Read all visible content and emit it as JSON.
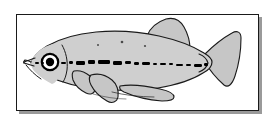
{
  "figure": {
    "kind": "scientific-line-illustration",
    "common_name": "medaka",
    "orientation": "lateral view, facing left",
    "caption": "",
    "background_color": "#ffffff"
  },
  "frame": {
    "border_color": "#1a1a1a",
    "border_width": 1,
    "fill_color": "#ffffff",
    "shadow_color": "#9a9a9a",
    "shadow_offset_x": 3,
    "shadow_offset_y": 3,
    "x": 16,
    "y": 14,
    "width": 243,
    "height": 97
  },
  "colors": {
    "body_fill": "#cfcfcf",
    "fin_fill": "#c6c6c6",
    "outline": "#1a1a1a",
    "stripe": "#000000",
    "eye_pupil": "#000000",
    "eye_ring": "#000000",
    "eye_white": "#ffffff",
    "spot": "#4a4a4a"
  },
  "anatomy": {
    "parts": [
      {
        "name": "body",
        "label": "Body"
      },
      {
        "name": "head",
        "label": "Head"
      },
      {
        "name": "eye",
        "label": "Eye"
      },
      {
        "name": "mouth",
        "label": "Mouth"
      },
      {
        "name": "operculum",
        "label": "Operculum"
      },
      {
        "name": "lateral-stripe",
        "label": "Lateral stripe"
      },
      {
        "name": "dorsal-fin",
        "label": "Dorsal fin"
      },
      {
        "name": "pectoral-fin",
        "label": "Pectoral fin"
      },
      {
        "name": "pelvic-fin",
        "label": "Pelvic fin"
      },
      {
        "name": "anal-fin",
        "label": "Anal fin"
      },
      {
        "name": "caudal-peduncle",
        "label": "Caudal peduncle"
      },
      {
        "name": "caudal-fin",
        "label": "Caudal fin"
      }
    ]
  },
  "geometry": {
    "body_path": "M 31 63 C 33 58 38 52 46 47 C 58 40 74 35 95 33 C 118 31 140 33 158 37 C 176 41 192 47 203 53 C 208 56 211 59 212 62 C 212 66 209 70 203 73 C 192 79 176 84 158 87 C 140 90 118 90 98 88 C 78 86 60 81 48 75 C 40 71 34 67 31 63 Z",
    "head_path": "M 26 63 C 27 60 29 57 32 54 C 36 50 42 46 49 43 C 54 41 58 44 60 48 L 62 56 C 63 60 63 66 62 70 L 60 78 C 58 83 53 85 48 83 C 41 80 35 75 30 70 C 28 67 26 65 26 63 Z",
    "mouth_path": "M 26 62 L 34 59 M 26 63 L 33 65 M 26 62 C 24 61 22 61 21 62 C 22 63 24 64 26 64",
    "eye": {
      "cx": 50,
      "cy": 62,
      "r_outer": 8.5,
      "r_inner": 4.2
    },
    "dorsal_fin_path": "M 147 36 C 150 28 157 22 166 19 C 174 17 180 20 184 27 C 188 34 190 42 190 49 C 190 52 188 54 185 54 C 176 53 166 49 158 44 C 152 41 148 38 147 36 Z",
    "pectoral_fin_path": "M 77 72 C 80 71 85 72 90 75 C 95 78 98 83 98 88 C 98 92 95 94 91 93 C 85 91 80 87 77 83 C 75 79 75 74 77 72 Z",
    "pelvic_fin_path": "M 92 76 C 98 74 106 76 112 80 C 117 84 119 90 118 96 C 117 101 113 103 108 101 C 101 98 95 92 92 86 C 90 82 90 78 92 76 Z",
    "anal_fin_path": "M 120 86 C 130 84 145 85 158 88 C 167 90 172 93 173 96 C 174 99 170 101 164 101 C 150 101 135 97 125 93 C 121 91 119 88 120 86 Z",
    "caudal_fin_path": "M 206 54 C 214 46 224 38 233 33 C 238 30 242 32 242 38 C 242 50 240 64 236 76 C 233 85 229 88 225 85 C 217 79 210 70 206 62 C 205 59 205 56 206 54 Z",
    "peduncle_path": "M 200 55 C 204 56 207 59 208 63 C 207 67 204 70 200 71",
    "stripe_segments": [
      {
        "x": 35,
        "y": 62,
        "w": 4,
        "h": 2
      },
      {
        "x": 41,
        "y": 62,
        "w": 3,
        "h": 2
      },
      {
        "x": 61,
        "y": 62,
        "w": 5,
        "h": 2
      },
      {
        "x": 69,
        "y": 61,
        "w": 4,
        "h": 3
      },
      {
        "x": 76,
        "y": 61,
        "w": 9,
        "h": 4
      },
      {
        "x": 88,
        "y": 60,
        "w": 7,
        "h": 4
      },
      {
        "x": 98,
        "y": 60,
        "w": 12,
        "h": 4
      },
      {
        "x": 113,
        "y": 61,
        "w": 9,
        "h": 4
      },
      {
        "x": 125,
        "y": 61,
        "w": 6,
        "h": 3
      },
      {
        "x": 134,
        "y": 62,
        "w": 5,
        "h": 3
      },
      {
        "x": 142,
        "y": 62,
        "w": 8,
        "h": 3
      },
      {
        "x": 153,
        "y": 63,
        "w": 4,
        "h": 2
      },
      {
        "x": 160,
        "y": 63,
        "w": 6,
        "h": 2
      },
      {
        "x": 169,
        "y": 63,
        "w": 4,
        "h": 2
      },
      {
        "x": 176,
        "y": 64,
        "w": 7,
        "h": 2
      },
      {
        "x": 186,
        "y": 64,
        "w": 5,
        "h": 2
      },
      {
        "x": 194,
        "y": 64,
        "w": 8,
        "h": 3
      },
      {
        "x": 204,
        "y": 63,
        "w": 4,
        "h": 3
      }
    ],
    "spots": [
      {
        "cx": 122,
        "cy": 42,
        "r": 1.3
      },
      {
        "cx": 145,
        "cy": 46,
        "r": 1.1
      },
      {
        "cx": 98,
        "cy": 45,
        "r": 1.0
      }
    ],
    "gill_line_path": "M 62 46 C 66 53 67 62 66 71 C 65 76 64 79 62 81",
    "belly_line_path": "M 66 78 C 78 84 92 88 108 90"
  }
}
